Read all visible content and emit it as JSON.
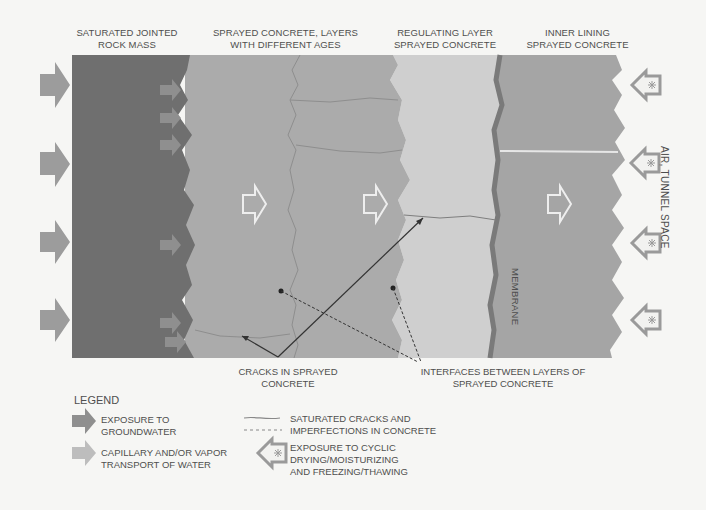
{
  "headers": {
    "rock": [
      "SATURATED JOINTED",
      "ROCK MASS"
    ],
    "sprayed": [
      "SPRAYED CONCRETE, LAYERS",
      "WITH DIFFERENT AGES"
    ],
    "regulating": [
      "REGULATING  LAYER",
      "SPRAYED CONCRETE"
    ],
    "inner": [
      "INNER LINING",
      "SPRAYED CONCRETE"
    ]
  },
  "side_label": "AIR, TUNNEL SPACE",
  "membrane_label": "MEMBRANE",
  "annotations": {
    "cracks": [
      "CRACKS IN SPRAYED",
      "CONCRETE"
    ],
    "interfaces": [
      "INTERFACES BETWEEN LAYERS OF",
      "SPRAYED CONCRETE"
    ]
  },
  "legend": {
    "title": "LEGEND",
    "groundwater": [
      "EXPOSURE TO",
      "GROUNDWATER"
    ],
    "capillary": [
      "CAPILLARY AND/OR VAPOR",
      "TRANSPORT OF WATER"
    ],
    "cracks": [
      "SATURATED CRACKS AND",
      "IMPERFECTIONS IN CONCRETE"
    ],
    "cyclic": [
      "EXPOSURE TO  CYCLIC",
      "DRYING/MOISTURIZING",
      "AND  FREEZING/THAWING"
    ]
  },
  "colors": {
    "rock": "#6f6f6f",
    "sprayed": "#a9a9a9",
    "regulating": "#cdcdcd",
    "inner": "#a2a2a2",
    "membrane": "#7e7e7e",
    "arrow": "#9c9c9c",
    "background": "#f6f6f4"
  }
}
